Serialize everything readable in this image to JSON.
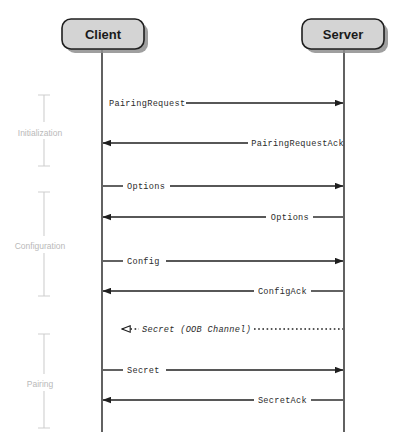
{
  "diagram": {
    "background_color": "#ffffff",
    "participants": [
      {
        "id": "client",
        "label": "Client",
        "lifeline_x": 102,
        "box_x": 62,
        "box_width": 82
      },
      {
        "id": "server",
        "label": "Server",
        "lifeline_x": 344,
        "box_x": 302,
        "box_width": 82
      }
    ],
    "box_style": {
      "fill": "#d4d4d4",
      "stroke": "#1f1f1f",
      "shadow": "#8e8e8e",
      "corner_radius": 9
    },
    "phases": [
      {
        "id": "initialization",
        "label": "Initialization",
        "y_start": 95,
        "y_end": 166,
        "label_y": 133
      },
      {
        "id": "configuration",
        "label": "Configuration",
        "y_start": 192,
        "y_end": 296,
        "label_y": 246
      },
      {
        "id": "pairing",
        "label": "Pairing",
        "y_start": 334,
        "y_end": 428,
        "label_y": 383
      }
    ],
    "phase_bracket_x": 44,
    "phase_label_x": 40,
    "messages": [
      {
        "id": "pairing-request",
        "label": "PairingRequest",
        "direction": "right",
        "style": "solid",
        "arrowhead": "filled",
        "label_align": "start",
        "y": 103,
        "label_x": 109,
        "label_width": 74
      },
      {
        "id": "pairing-request-ack",
        "label": "PairingRequestAck",
        "direction": "left",
        "style": "solid",
        "arrowhead": "filled",
        "label_align": "end",
        "y": 143,
        "label_x": 344,
        "label_width": 90
      },
      {
        "id": "options-request",
        "label": "Options",
        "direction": "right",
        "style": "solid",
        "arrowhead": "filled",
        "label_align": "start",
        "y": 186,
        "label_x": 127,
        "label_width": 38
      },
      {
        "id": "options-response",
        "label": "Options",
        "direction": "left",
        "style": "solid",
        "arrowhead": "filled",
        "label_align": "end",
        "y": 217,
        "label_x": 308,
        "label_width": 38
      },
      {
        "id": "config-request",
        "label": "Config",
        "direction": "right",
        "style": "solid",
        "arrowhead": "filled",
        "label_align": "start",
        "y": 261,
        "label_x": 127,
        "label_width": 34
      },
      {
        "id": "config-ack",
        "label": "ConfigAck",
        "direction": "left",
        "style": "solid",
        "arrowhead": "filled",
        "label_align": "end",
        "y": 291,
        "label_x": 306,
        "label_width": 48
      },
      {
        "id": "secret-oob",
        "label": "Secret (OOB Channel)",
        "direction": "left",
        "style": "dotted",
        "arrowhead": "open",
        "label_align": "start",
        "y": 329,
        "label_x": 141,
        "label_width": 112
      },
      {
        "id": "secret-request",
        "label": "Secret",
        "direction": "right",
        "style": "solid",
        "arrowhead": "filled",
        "label_align": "start",
        "y": 370,
        "label_x": 127,
        "label_width": 34
      },
      {
        "id": "secret-ack",
        "label": "SecretAck",
        "direction": "left",
        "style": "solid",
        "arrowhead": "filled",
        "label_align": "end",
        "y": 400,
        "label_x": 306,
        "label_width": 48
      }
    ]
  }
}
